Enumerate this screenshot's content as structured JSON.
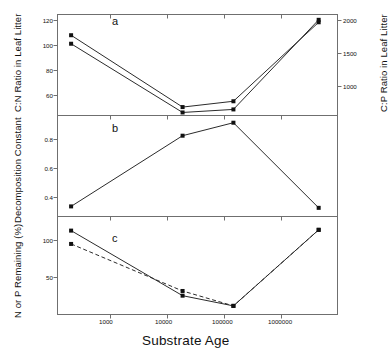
{
  "figure": {
    "xlabel": "Substrate Age",
    "panel_letters": [
      "a",
      "b",
      "c"
    ]
  },
  "chart_data": [
    {
      "type": "line",
      "panel": "a",
      "title": "",
      "xlabel": "Substrate Age",
      "ylabel": "C:N Ratio in Leaf Litter",
      "ylabel_right": "C:P Ratio in Leaf Litter",
      "xscale": "log",
      "xlim": [
        200,
        6000000
      ],
      "ylim": [
        50,
        128
      ],
      "ylim_right": [
        800,
        2130
      ],
      "yticks": [
        60,
        80,
        100,
        120
      ],
      "yticks_right": [
        1000,
        1500,
        2000
      ],
      "xticks": [
        1000,
        10000,
        100000,
        1000000
      ],
      "grid": false,
      "legend": "none",
      "series": [
        {
          "name": "C:N Ratio",
          "style": "solid",
          "x": [
            330,
            20000,
            130000,
            3000000
          ],
          "values": [
            112,
            56.5,
            61,
            122
          ]
        },
        {
          "name": "C:P Ratio",
          "style": "solid",
          "x": [
            330,
            20000,
            130000,
            3000000
          ],
          "values": [
            1745,
            840,
            880,
            2060
          ]
        }
      ]
    },
    {
      "type": "line",
      "panel": "b",
      "title": "",
      "xlabel": "Substrate Age",
      "ylabel": "Decomposition Constant",
      "xscale": "log",
      "xlim": [
        200,
        6000000
      ],
      "ylim": [
        0.27,
        0.97
      ],
      "yticks": [
        0.4,
        0.6,
        0.8
      ],
      "xticks": [
        1000,
        10000,
        100000,
        1000000
      ],
      "grid": false,
      "legend": "none",
      "series": [
        {
          "name": "Decomposition Constant",
          "style": "solid",
          "x": [
            330,
            20000,
            130000,
            3000000
          ],
          "values": [
            0.34,
            0.83,
            0.92,
            0.33
          ]
        }
      ]
    },
    {
      "type": "line",
      "panel": "c",
      "title": "",
      "xlabel": "Substrate Age",
      "ylabel": "N or P Remaining (%)",
      "xscale": "log",
      "xlim": [
        200,
        6000000
      ],
      "ylim": [
        5,
        130
      ],
      "yticks": [
        50,
        100
      ],
      "xticks": [
        1000,
        10000,
        100000,
        1000000
      ],
      "grid": false,
      "legend": "none",
      "series": [
        {
          "name": "N Remaining",
          "style": "solid",
          "x": [
            330,
            20000,
            130000,
            3000000
          ],
          "values": [
            112,
            29,
            16,
            113
          ]
        },
        {
          "name": "P Remaining",
          "style": "dashed",
          "x": [
            330,
            20000,
            130000,
            3000000
          ],
          "values": [
            95,
            35,
            16,
            113
          ]
        }
      ]
    }
  ],
  "axes": {
    "panel_a": {
      "ylabel": "C:N Ratio in Leaf Litter",
      "ylabel_right": "C:P Ratio in Leaf Litter",
      "yticklabels": [
        "120",
        "100",
        "80",
        "60"
      ],
      "yticklabels_right": [
        "2000",
        "1500",
        "1000"
      ]
    },
    "panel_b": {
      "ylabel": "Decomposition Constant",
      "yticklabels": [
        "0.8",
        "0.6",
        "0.4"
      ]
    },
    "panel_c": {
      "ylabel": "N or P Remaining (%)",
      "yticklabels": [
        "100",
        "50"
      ]
    },
    "xticklabels": [
      "1000",
      "10000",
      "100000",
      "1000000"
    ]
  }
}
